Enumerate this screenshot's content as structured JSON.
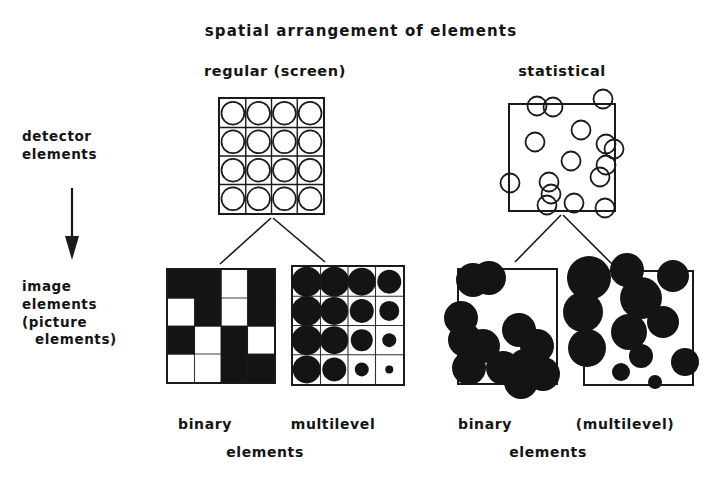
{
  "title": "spatial arrangement of elements",
  "headers": {
    "regular": "regular (screen)",
    "statistical": "statistical"
  },
  "row_labels": {
    "detector_line1": "detector",
    "detector_line2": "elements",
    "image_line1": "image",
    "image_line2": "elements",
    "image_line3": "(picture",
    "image_line4": "elements)"
  },
  "bottom_labels": {
    "binary_left": "binary",
    "multilevel_left": "multilevel",
    "elements_left": "elements",
    "binary_right": "binary",
    "multilevel_right": "(multilevel)",
    "elements_right": "elements"
  },
  "colors": {
    "ink": "#1a1a1a",
    "fill": "#141414",
    "background": "#ffffff"
  },
  "chart_data": {
    "type": "diagram",
    "title": "spatial arrangement of elements",
    "columns": [
      "regular (screen)",
      "statistical"
    ],
    "rows": [
      "detector elements",
      "image elements (picture elements)"
    ],
    "panels": {
      "regular_detector": {
        "arrangement": "regular",
        "grid": {
          "rows": 4,
          "cols": 4
        },
        "marker": "open-circle",
        "count": 16
      },
      "statistical_detector": {
        "arrangement": "random",
        "marker": "open-circle",
        "count": 21,
        "radius": 9,
        "circles": [
          {
            "cx": 28,
            "cy": 4
          },
          {
            "cx": 44,
            "cy": 3
          },
          {
            "cx": 96,
            "cy": -4
          },
          {
            "cx": 26,
            "cy": 38
          },
          {
            "cx": 74,
            "cy": 26
          },
          {
            "cx": 99,
            "cy": 40
          },
          {
            "cx": 107,
            "cy": 46
          },
          {
            "cx": 63,
            "cy": 58
          },
          {
            "cx": 99,
            "cy": 62
          },
          {
            "cx": 93,
            "cy": 74
          },
          {
            "cx": 2,
            "cy": 80
          },
          {
            "cx": 40,
            "cy": 80
          },
          {
            "cx": 42,
            "cy": 92
          },
          {
            "cx": 38,
            "cy": 103
          },
          {
            "cx": 66,
            "cy": 101
          },
          {
            "cx": 98,
            "cy": 106
          }
        ]
      },
      "regular_binary": {
        "arrangement": "regular",
        "levels": 2,
        "grid": {
          "rows": 4,
          "cols": 4
        },
        "cells": [
          [
            1,
            1,
            0,
            1
          ],
          [
            0,
            1,
            0,
            1
          ],
          [
            1,
            0,
            1,
            0
          ],
          [
            0,
            0,
            1,
            1
          ]
        ]
      },
      "regular_multilevel": {
        "arrangement": "regular",
        "levels": "continuous",
        "grid": {
          "rows": 4,
          "cols": 4
        },
        "dot_radius": [
          [
            15,
            15,
            14,
            12
          ],
          [
            15,
            14,
            12,
            10
          ],
          [
            15,
            14,
            11,
            7
          ],
          [
            14,
            12,
            7,
            4
          ]
        ]
      },
      "statistical_binary": {
        "arrangement": "random",
        "levels": 2,
        "uniform_radius": 17,
        "blobs": [
          {
            "cx": 14,
            "cy": 10
          },
          {
            "cx": 30,
            "cy": 8
          },
          {
            "cx": 2,
            "cy": 48
          },
          {
            "cx": 6,
            "cy": 70
          },
          {
            "cx": 24,
            "cy": 76
          },
          {
            "cx": 10,
            "cy": 98
          },
          {
            "cx": 44,
            "cy": 98
          },
          {
            "cx": 60,
            "cy": 60
          },
          {
            "cx": 78,
            "cy": 76
          },
          {
            "cx": 66,
            "cy": 96
          },
          {
            "cx": 84,
            "cy": 104
          },
          {
            "cx": 62,
            "cy": 112
          }
        ]
      },
      "statistical_multilevel": {
        "arrangement": "random",
        "levels": "continuous",
        "blobs": [
          {
            "cx": 4,
            "cy": 6,
            "r": 22
          },
          {
            "cx": 42,
            "cy": -2,
            "r": 17
          },
          {
            "cx": -2,
            "cy": 40,
            "r": 20
          },
          {
            "cx": 56,
            "cy": 26,
            "r": 21
          },
          {
            "cx": 88,
            "cy": 4,
            "r": 16
          },
          {
            "cx": 78,
            "cy": 50,
            "r": 16
          },
          {
            "cx": 44,
            "cy": 60,
            "r": 18
          },
          {
            "cx": 2,
            "cy": 76,
            "r": 19
          },
          {
            "cx": 56,
            "cy": 84,
            "r": 12
          },
          {
            "cx": 36,
            "cy": 100,
            "r": 9
          },
          {
            "cx": 70,
            "cy": 110,
            "r": 7
          },
          {
            "cx": 100,
            "cy": 90,
            "r": 14
          }
        ]
      }
    }
  }
}
